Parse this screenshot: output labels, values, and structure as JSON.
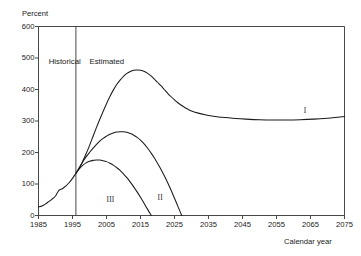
{
  "chart_data": {
    "type": "line",
    "title": "",
    "subtitle": "",
    "ylabel": "Percent",
    "xlabel": "Calendar year",
    "xlim": [
      1985,
      2075
    ],
    "ylim": [
      0,
      600
    ],
    "grid": false,
    "legend_position": "inline-labels",
    "y_ticks": [
      "0",
      "100",
      "200",
      "300",
      "400",
      "500",
      "600"
    ],
    "y_tick_values": [
      0,
      100,
      200,
      300,
      400,
      500,
      600
    ],
    "x_ticks": [
      "1985",
      "1995",
      "2005",
      "2015",
      "2025",
      "2035",
      "2045",
      "2055",
      "2065",
      "2075"
    ],
    "x_tick_values": [
      1985,
      1995,
      2005,
      2015,
      2025,
      2035,
      2045,
      2055,
      2065,
      2075
    ],
    "annotations": [
      {
        "name": "historical-region-label",
        "text": "Historical",
        "x": 1988,
        "y": 487
      },
      {
        "name": "estimated-region-label",
        "text": "Estimated",
        "x": 2000,
        "y": 487
      },
      {
        "name": "divider-year",
        "text": "",
        "x": 1996,
        "y": 600
      }
    ],
    "divider_x": 1996,
    "series": [
      {
        "name": "I",
        "label": "I",
        "label_x": 2063,
        "label_y": 333,
        "points": [
          [
            1985,
            27
          ],
          [
            1986,
            30
          ],
          [
            1987,
            36
          ],
          [
            1988,
            44
          ],
          [
            1989,
            52
          ],
          [
            1990,
            62
          ],
          [
            1991,
            80
          ],
          [
            1992,
            85
          ],
          [
            1993,
            93
          ],
          [
            1994,
            104
          ],
          [
            1995,
            118
          ],
          [
            1996,
            134
          ],
          [
            1997,
            150
          ],
          [
            1998,
            172
          ],
          [
            1999,
            196
          ],
          [
            2000,
            222
          ],
          [
            2001,
            250
          ],
          [
            2002,
            278
          ],
          [
            2003,
            305
          ],
          [
            2004,
            330
          ],
          [
            2005,
            355
          ],
          [
            2006,
            378
          ],
          [
            2007,
            398
          ],
          [
            2008,
            416
          ],
          [
            2009,
            430
          ],
          [
            2010,
            442
          ],
          [
            2011,
            451
          ],
          [
            2012,
            457
          ],
          [
            2013,
            461
          ],
          [
            2014,
            462
          ],
          [
            2015,
            461
          ],
          [
            2016,
            458
          ],
          [
            2017,
            452
          ],
          [
            2018,
            444
          ],
          [
            2019,
            434
          ],
          [
            2020,
            423
          ],
          [
            2021,
            412
          ],
          [
            2022,
            400
          ],
          [
            2023,
            388
          ],
          [
            2024,
            377
          ],
          [
            2025,
            367
          ],
          [
            2026,
            358
          ],
          [
            2027,
            350
          ],
          [
            2028,
            343
          ],
          [
            2029,
            337
          ],
          [
            2030,
            332
          ],
          [
            2032,
            325
          ],
          [
            2034,
            320
          ],
          [
            2036,
            316
          ],
          [
            2038,
            313
          ],
          [
            2040,
            311
          ],
          [
            2043,
            308
          ],
          [
            2046,
            306
          ],
          [
            2050,
            304
          ],
          [
            2054,
            303
          ],
          [
            2058,
            303
          ],
          [
            2062,
            304
          ],
          [
            2066,
            306
          ],
          [
            2070,
            309
          ],
          [
            2073,
            312
          ],
          [
            2075,
            314
          ]
        ]
      },
      {
        "name": "II",
        "label": "II",
        "label_x": 2020,
        "label_y": 57,
        "points": [
          [
            1996,
            134
          ],
          [
            1997,
            152
          ],
          [
            1998,
            170
          ],
          [
            1999,
            186
          ],
          [
            2000,
            200
          ],
          [
            2001,
            213
          ],
          [
            2002,
            225
          ],
          [
            2003,
            236
          ],
          [
            2004,
            245
          ],
          [
            2005,
            252
          ],
          [
            2006,
            258
          ],
          [
            2007,
            262
          ],
          [
            2008,
            265
          ],
          [
            2009,
            266
          ],
          [
            2010,
            266
          ],
          [
            2011,
            264
          ],
          [
            2012,
            260
          ],
          [
            2013,
            255
          ],
          [
            2014,
            248
          ],
          [
            2015,
            239
          ],
          [
            2016,
            228
          ],
          [
            2017,
            215
          ],
          [
            2018,
            200
          ],
          [
            2019,
            184
          ],
          [
            2020,
            166
          ],
          [
            2021,
            147
          ],
          [
            2022,
            126
          ],
          [
            2023,
            104
          ],
          [
            2024,
            80
          ],
          [
            2025,
            55
          ],
          [
            2026,
            29
          ],
          [
            2027,
            3
          ],
          [
            2027.2,
            0
          ]
        ]
      },
      {
        "name": "III",
        "label": "III",
        "label_x": 2005,
        "label_y": 50,
        "points": [
          [
            1996,
            134
          ],
          [
            1997,
            148
          ],
          [
            1998,
            159
          ],
          [
            1999,
            167
          ],
          [
            2000,
            172
          ],
          [
            2001,
            175
          ],
          [
            2002,
            176
          ],
          [
            2003,
            176
          ],
          [
            2004,
            174
          ],
          [
            2005,
            171
          ],
          [
            2006,
            166
          ],
          [
            2007,
            160
          ],
          [
            2008,
            152
          ],
          [
            2009,
            143
          ],
          [
            2010,
            132
          ],
          [
            2011,
            120
          ],
          [
            2012,
            106
          ],
          [
            2013,
            91
          ],
          [
            2014,
            75
          ],
          [
            2015,
            58
          ],
          [
            2016,
            40
          ],
          [
            2017,
            21
          ],
          [
            2018,
            3
          ],
          [
            2018.2,
            0
          ]
        ]
      }
    ]
  }
}
